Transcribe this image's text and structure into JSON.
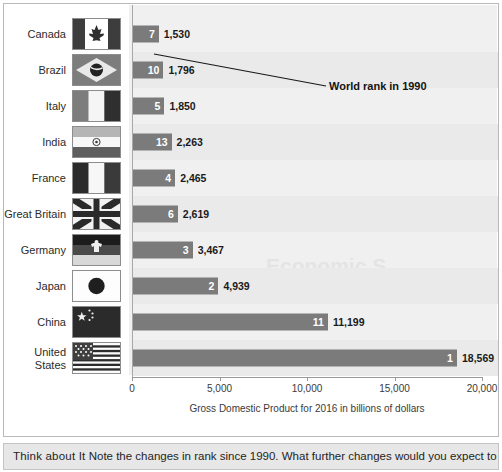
{
  "chart_data": {
    "type": "bar",
    "orientation": "horizontal",
    "title": "",
    "xlabel": "Gross Domestic Product for 2016 in billions of dollars",
    "ylabel": "",
    "xlim": [
      0,
      20000
    ],
    "xticks": [
      0,
      5000,
      10000,
      15000,
      20000
    ],
    "xticklabels": [
      "0",
      "5,000",
      "10,000",
      "15,000",
      "20,000"
    ],
    "grid": false,
    "legend": "none",
    "categories": [
      "Canada",
      "Brazil",
      "Italy",
      "India",
      "France",
      "Great Britain",
      "Germany",
      "Japan",
      "China",
      "United States"
    ],
    "values": [
      1530,
      1796,
      1850,
      2263,
      2465,
      2619,
      3467,
      4939,
      11199,
      18569
    ],
    "value_labels": [
      "1,530",
      "1,796",
      "1,850",
      "2,263",
      "2,465",
      "2,619",
      "3,467",
      "4,939",
      "11,199",
      "18,569"
    ],
    "rank_1990": [
      7,
      10,
      5,
      13,
      4,
      6,
      3,
      2,
      11,
      1
    ],
    "rank_labels": [
      "7",
      "10",
      "5",
      "13",
      "4",
      "6",
      "3",
      "2",
      "11",
      "1"
    ],
    "bar_color": "#7b7b7b",
    "plot_background": "#f0f0f0",
    "annotation": "World rank in 1990"
  },
  "rows": [
    {
      "label": "Canada",
      "flag": "flag-canada",
      "rank": "7",
      "value_label": "1,530",
      "value": 1530
    },
    {
      "label": "Brazil",
      "flag": "flag-brazil",
      "rank": "10",
      "value_label": "1,796",
      "value": 1796
    },
    {
      "label": "Italy",
      "flag": "flag-italy",
      "rank": "5",
      "value_label": "1,850",
      "value": 1850
    },
    {
      "label": "India",
      "flag": "flag-india",
      "rank": "13",
      "value_label": "2,263",
      "value": 2263
    },
    {
      "label": "France",
      "flag": "flag-france",
      "rank": "4",
      "value_label": "2,465",
      "value": 2465
    },
    {
      "label": "Great Britain",
      "flag": "flag-great-britain",
      "rank": "6",
      "value_label": "2,619",
      "value": 2619
    },
    {
      "label": "Germany",
      "flag": "flag-germany",
      "rank": "3",
      "value_label": "3,467",
      "value": 3467
    },
    {
      "label": "Japan",
      "flag": "flag-japan",
      "rank": "2",
      "value_label": "4,939",
      "value": 4939
    },
    {
      "label": "China",
      "flag": "flag-china",
      "rank": "11",
      "value_label": "11,199",
      "value": 11199
    },
    {
      "label": "United\nStates",
      "flag": "flag-united-states",
      "rank": "1",
      "value_label": "18,569",
      "value": 18569
    }
  ],
  "axis": {
    "ticks": [
      "0",
      "5,000",
      "10,000",
      "15,000",
      "20,000"
    ],
    "title": "Gross Domestic Product for 2016 in billions of dollars"
  },
  "callout": {
    "label": "World rank in 1990"
  },
  "footer": {
    "lead": "Think about It",
    "text": "Note the changes in rank since 1990. What further changes would you expect to"
  },
  "ghost": {
    "word": "Economic S"
  },
  "colors": {
    "bar": "#7b7b7b",
    "plot_bg": "#f0f0f0",
    "band": "#eaeaea",
    "frame": "#b9b9b9",
    "footer_bg": "#e7e7e7",
    "text": "#2b2b2b"
  }
}
